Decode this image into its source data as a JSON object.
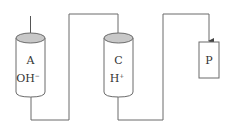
{
  "diagram": {
    "type": "ion-exchange column flow diagram",
    "colors": {
      "line": "#6b6b6b",
      "cylinder_top_fill": "#c8c8c8",
      "text": "#333333"
    },
    "nodes": [
      {
        "id": "A",
        "shape": "cylinder",
        "label": "A",
        "ion": "OH",
        "ion_charge": "−"
      },
      {
        "id": "C",
        "shape": "cylinder",
        "label": "C",
        "ion": "H",
        "ion_charge": "+"
      },
      {
        "id": "P",
        "shape": "rectangle",
        "label": "P"
      }
    ],
    "edges": [
      {
        "from": "inlet",
        "to": "A",
        "arrow": true
      },
      {
        "from": "A",
        "to": "C",
        "arrow": false
      },
      {
        "from": "C",
        "to": "P",
        "arrow": true
      }
    ]
  }
}
